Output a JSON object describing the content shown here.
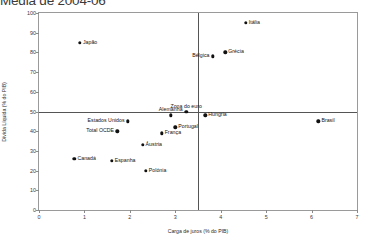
{
  "chart_data": {
    "type": "scatter",
    "title": "Média de 2004-06",
    "xlabel": "Carga de juros (% do PIB)",
    "ylabel": "Dívida Líquida (% do PIB)",
    "xlim": [
      0,
      7
    ],
    "ylim": [
      0,
      100
    ],
    "xticks": [
      "0",
      "1",
      "2",
      "3",
      "4",
      "5",
      "6",
      "7"
    ],
    "yticks": [
      "0",
      "10",
      "20",
      "30",
      "40",
      "50",
      "60",
      "70",
      "80",
      "90",
      "100"
    ],
    "grid": false,
    "legend": "none",
    "marker_color": "#111111",
    "reference_lines": {
      "horizontal_y": 50,
      "vertical_x": 3.5,
      "color": "#555555"
    },
    "points": [
      {
        "label": "Itália",
        "x": 4.55,
        "y": 95,
        "label_pos": "right"
      },
      {
        "label": "Japão",
        "x": 0.9,
        "y": 85,
        "label_pos": "right"
      },
      {
        "label": "Grécia",
        "x": 4.1,
        "y": 80,
        "label_pos": "right"
      },
      {
        "label": "Bélgica",
        "x": 3.82,
        "y": 78,
        "label_pos": "left"
      },
      {
        "label": "Zona do euro",
        "x": 3.24,
        "y": 50,
        "label_pos": "above"
      },
      {
        "label": "Alemanha",
        "x": 2.9,
        "y": 48,
        "label_pos": "above"
      },
      {
        "label": "Hungria",
        "x": 3.66,
        "y": 48,
        "label_pos": "right"
      },
      {
        "label": "Brasil",
        "x": 6.15,
        "y": 45,
        "label_pos": "right"
      },
      {
        "label": "Estados Unidos",
        "x": 1.95,
        "y": 45,
        "label_pos": "left"
      },
      {
        "label": "Portugal",
        "x": 3.0,
        "y": 42,
        "label_pos": "right"
      },
      {
        "label": "Total OCDE",
        "x": 1.72,
        "y": 40,
        "label_pos": "left"
      },
      {
        "label": "França",
        "x": 2.7,
        "y": 39,
        "label_pos": "right"
      },
      {
        "label": "Áustria",
        "x": 2.28,
        "y": 33,
        "label_pos": "right"
      },
      {
        "label": "Canadá",
        "x": 0.78,
        "y": 26,
        "label_pos": "right"
      },
      {
        "label": "Espanha",
        "x": 1.6,
        "y": 25,
        "label_pos": "right"
      },
      {
        "label": "Polónia",
        "x": 2.35,
        "y": 20,
        "label_pos": "right"
      }
    ]
  }
}
